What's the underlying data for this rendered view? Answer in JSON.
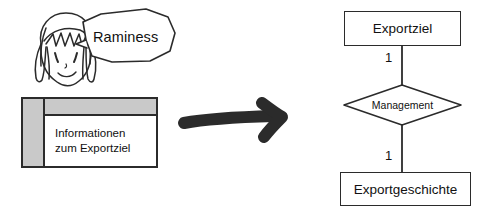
{
  "canvas": {
    "width": 487,
    "height": 217,
    "background": "#ffffff",
    "ink_color": "#2b2b2b",
    "fill_gray": "#c9c9c9"
  },
  "left_panel": {
    "character": {
      "icon": "manga-face-icon",
      "description": "hand-drawn manga style face with long hair"
    },
    "speech_bubble": {
      "icon": "speech-bubble-icon",
      "text": "Raminess"
    },
    "table": {
      "icon": "table-icon",
      "header_label": "",
      "corner_label": "",
      "side_label": "",
      "cell_lines": [
        "Informationen",
        "zum Exportziel"
      ]
    }
  },
  "arrow": {
    "icon": "right-arrow-icon",
    "direction": "right",
    "color": "#2b2b2b"
  },
  "er_diagram": {
    "entity_top": {
      "label": "Exportziel",
      "shape": "rectangle"
    },
    "relationship": {
      "label": "Management",
      "shape": "diamond"
    },
    "entity_bottom": {
      "label": "Exportgeschichte",
      "shape": "rectangle"
    },
    "cardinality_top": "1",
    "cardinality_bottom": "1"
  }
}
